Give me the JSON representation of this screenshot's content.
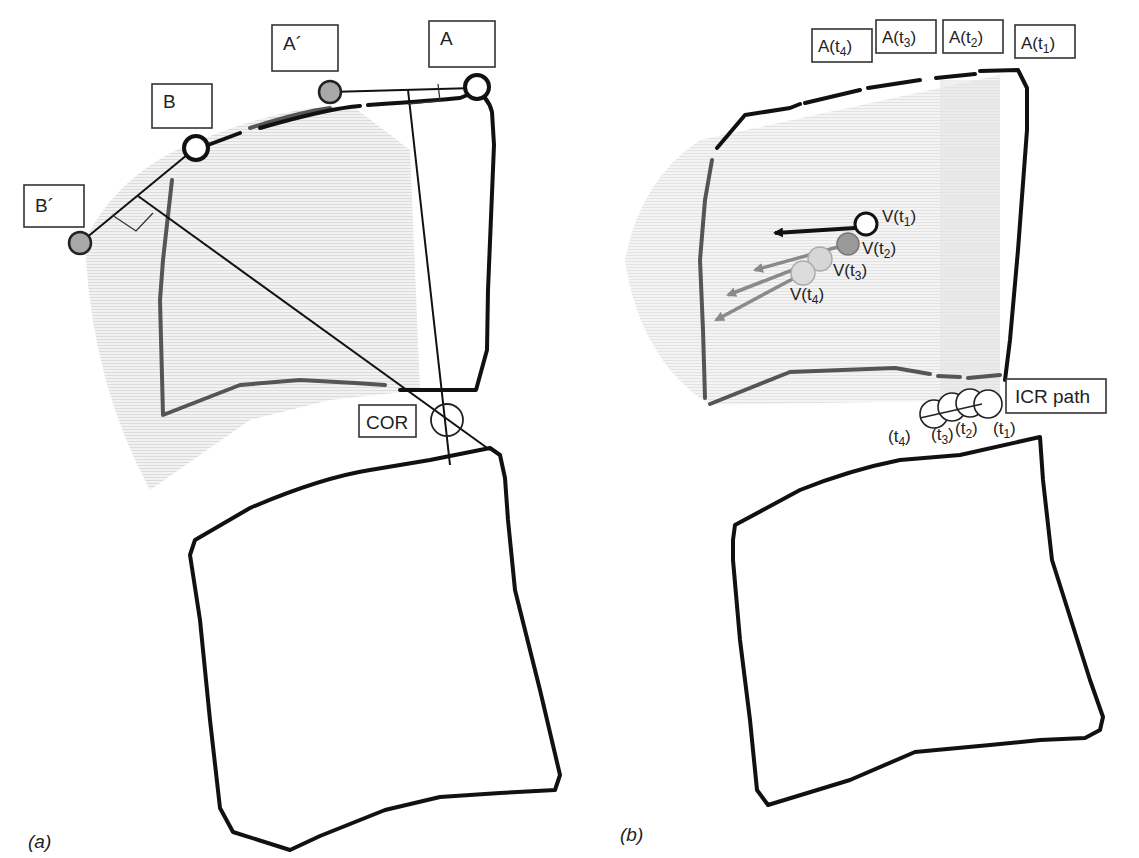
{
  "figure": {
    "panel_a": {
      "label": "(a)",
      "markers": {
        "A": "A",
        "A_prime": "A´",
        "B": "B",
        "B_prime": "B´",
        "COR": "COR"
      }
    },
    "panel_b": {
      "label": "(b)",
      "positions": [
        {
          "base": "A(t",
          "sub": "4",
          "close": ")"
        },
        {
          "base": "A(t",
          "sub": "3",
          "close": ")"
        },
        {
          "base": "A(t",
          "sub": "2",
          "close": ")"
        },
        {
          "base": "A(t",
          "sub": "1",
          "close": ")"
        }
      ],
      "velocities": [
        {
          "base": "V(t",
          "sub": "1",
          "close": ")"
        },
        {
          "base": "V(t",
          "sub": "2",
          "close": ")"
        },
        {
          "base": "V(t",
          "sub": "3",
          "close": ")"
        },
        {
          "base": "V(t",
          "sub": "4",
          "close": ")"
        }
      ],
      "icr_label": "ICR path",
      "icr_times": [
        {
          "base": "(t",
          "sub": "4",
          "close": ")"
        },
        {
          "base": "(t",
          "sub": "3",
          "close": ")"
        },
        {
          "base": "(t",
          "sub": "2",
          "close": ")"
        },
        {
          "base": "(t",
          "sub": "1",
          "close": ")"
        }
      ]
    },
    "colors": {
      "outline": "#111111",
      "ghost_outline": "#555555",
      "shade": "#e6e6e6",
      "marker_gray": "#a8a8a8",
      "v2_fill": "#9a9a9a",
      "v3_fill": "#d6d6d6",
      "v4_fill": "#dcdcdc",
      "arrow_gray": "#8a8a8a"
    }
  }
}
